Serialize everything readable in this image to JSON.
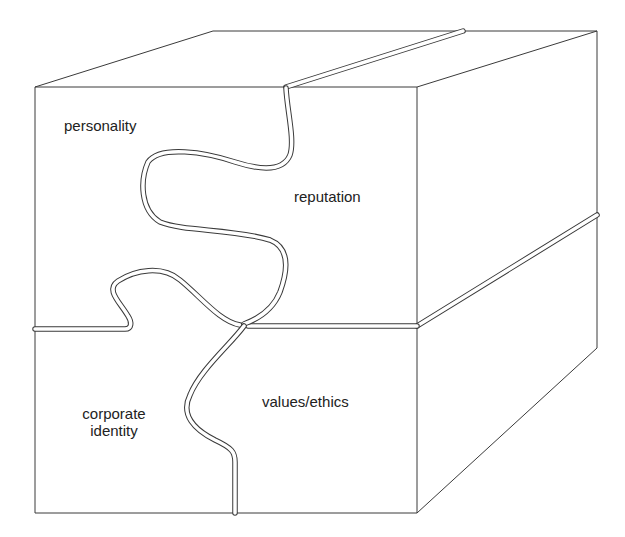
{
  "diagram": {
    "type": "3d-block-puzzle",
    "pieces": [
      {
        "id": "top-left",
        "label": "personality"
      },
      {
        "id": "top-right",
        "label": "reputation"
      },
      {
        "id": "bottom-left",
        "label": "corporate identity",
        "lines": [
          "corporate",
          "identity"
        ]
      },
      {
        "id": "bottom-right",
        "label": "values/ethics"
      }
    ],
    "colors": {
      "line": "#3a3a3a",
      "text": "#222222",
      "background": "#ffffff"
    }
  }
}
